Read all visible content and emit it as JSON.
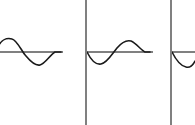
{
  "figure": {
    "title": "",
    "width": 195,
    "height": 125,
    "background_color": "#ffffff",
    "axis_color": "#808080",
    "divider_color": "#808080",
    "wave_color": "#1a1a1a",
    "axis_y": 52,
    "wave_stroke_width": 1.6,
    "axis_stroke_width": 1.2,
    "divider_stroke_width": 1.2,
    "dividers": [
      {
        "name": "divider-1",
        "x": 86,
        "y1": 0,
        "y2": 125
      },
      {
        "name": "divider-2",
        "x": 171,
        "y1": 0,
        "y2": 125
      }
    ],
    "panels": [
      {
        "id": "panel-1",
        "label": "",
        "axis": {
          "x1": 0,
          "x2": 63,
          "y": 52
        },
        "wave": {
          "phase": "crest-then-trough",
          "amplitude": 13,
          "wavelength": 56,
          "x_start": -4,
          "x_end": 61,
          "crest_x": 12,
          "crest_y": 39,
          "trough_x": 39,
          "trough_y": 65,
          "path": "M -4 52 C 0 38 8 38 12 39 C 17 40 22 52 26 56 C 31 62 36 66 40 65 C 45 64 50 55 55 52 L 61 52"
        }
      },
      {
        "id": "panel-2",
        "label": "",
        "axis": {
          "x1": 87,
          "x2": 153,
          "y": 52
        },
        "wave": {
          "phase": "trough-then-crest",
          "amplitude": 13,
          "wavelength": 56,
          "x_start": 87,
          "x_end": 150,
          "trough_x": 100,
          "trough_y": 64,
          "crest_x": 128,
          "crest_y": 41,
          "path": "M 87 52 C 91 60 96 65 101 64 C 107 63 112 54 117 48 C 122 42 127 40 131 41 C 136 43 141 50 145 52 L 150 52"
        }
      },
      {
        "id": "panel-3",
        "label": "",
        "axis": {
          "x1": 172,
          "x2": 195,
          "y": 52
        },
        "wave": {
          "phase": "descending-trough-clipped",
          "amplitude": 13,
          "wavelength": 56,
          "x_start": 172,
          "x_end": 195,
          "clipped": true,
          "path": "M 172 52 C 176 60 181 66 186 67 C 190 68 193 65 195 61"
        }
      }
    ]
  }
}
